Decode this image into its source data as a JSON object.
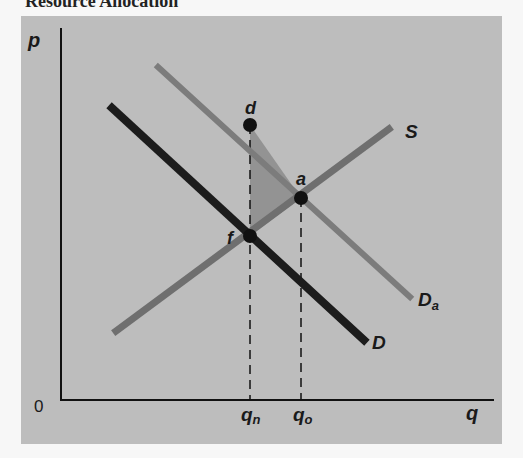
{
  "header": {
    "text": "Resource Allocation"
  },
  "diagram": {
    "axes": {
      "y_label": "p",
      "x_label": "q",
      "origin_label": "0"
    },
    "curves": [
      {
        "id": "S",
        "label": "S",
        "color": "#6f6f6f"
      },
      {
        "id": "Da",
        "label": "D",
        "sub": "a",
        "color": "#7c7c7c"
      },
      {
        "id": "D",
        "label": "D",
        "color": "#1c1c1c"
      }
    ],
    "points": [
      {
        "id": "d",
        "label": "d"
      },
      {
        "id": "a",
        "label": "a"
      },
      {
        "id": "f",
        "label": "f"
      }
    ],
    "ticks": [
      {
        "id": "qn",
        "label": "q",
        "sub": "n"
      },
      {
        "id": "qo",
        "label": "q",
        "sub": "o"
      }
    ],
    "shaded_region": {
      "vertices": [
        "d",
        "a",
        "f"
      ],
      "color": "#909090"
    }
  }
}
